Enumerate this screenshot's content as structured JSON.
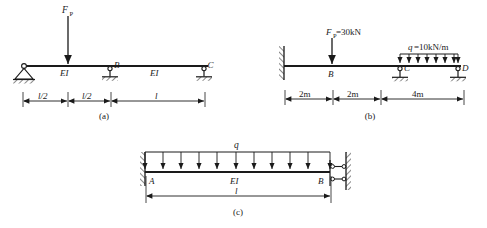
{
  "sheet": {
    "title": "Statically indeterminate beam examples",
    "background": "#ffffff",
    "ink": "#1a1a1a"
  },
  "figures": [
    {
      "id": "a",
      "caption": "(a)",
      "type": "continuous-beam",
      "supports": [
        {
          "at": "left",
          "kind": "pinned-hatched",
          "label": ""
        },
        {
          "at": "middle",
          "kind": "link-rod-hatched",
          "label": "B"
        },
        {
          "at": "right",
          "kind": "link-rod-hatched",
          "label": "C"
        }
      ],
      "loads": [
        {
          "kind": "point-load",
          "label": "F",
          "sub": "P",
          "value": "",
          "position": "l/2 from left"
        }
      ],
      "span_labels": [
        "EI",
        "EI"
      ],
      "dimensions": [
        {
          "text": "l/2"
        },
        {
          "text": "l/2"
        },
        {
          "text": "l"
        }
      ]
    },
    {
      "id": "b",
      "caption": "(b)",
      "type": "propped-beam",
      "supports": [
        {
          "at": "left",
          "kind": "fixed-wall",
          "label": ""
        },
        {
          "at": "C",
          "kind": "link-rod-hatched",
          "label": "C"
        },
        {
          "at": "D",
          "kind": "link-rod-hatched",
          "label": "D"
        }
      ],
      "loads": [
        {
          "kind": "point-load",
          "label": "F",
          "sub": "P",
          "value": "=30kN",
          "text": "F P =30kN"
        },
        {
          "kind": "distributed-load",
          "label": "q",
          "value": "=10kN/m",
          "text": "q=10kN/m"
        }
      ],
      "node_labels": [
        "B",
        "C",
        "D"
      ],
      "dimensions": [
        {
          "text": "2m"
        },
        {
          "text": "2m"
        },
        {
          "text": "4m"
        }
      ]
    },
    {
      "id": "c",
      "caption": "(c)",
      "type": "fixed-guided-beam",
      "supports": [
        {
          "at": "A",
          "kind": "fixed-wall",
          "label": "A"
        },
        {
          "at": "B",
          "kind": "double-link-guided",
          "label": "B"
        }
      ],
      "loads": [
        {
          "kind": "distributed-load",
          "label": "q",
          "value": "",
          "text": "q"
        }
      ],
      "span_labels": [
        "EI"
      ],
      "dimensions": [
        {
          "text": "l"
        }
      ]
    }
  ],
  "text": {
    "fp_main": "F",
    "fp_sub": "P",
    "fp_b_value": "=30kN",
    "q_b": "q",
    "q_b_value": "=10kN/m",
    "q_c": "q",
    "ei": "EI",
    "node_b_a": "B",
    "node_c_a": "C",
    "node_b_b": "B",
    "node_c_b": "C",
    "node_d_b": "D",
    "node_a_c": "A",
    "node_b_c": "B",
    "dim_a_1": "l/2",
    "dim_a_2": "l/2",
    "dim_a_3": "l",
    "dim_b_1": "2m",
    "dim_b_2": "2m",
    "dim_b_3": "4m",
    "dim_c_1": "l",
    "caption_a": "(a)",
    "caption_b": "(b)",
    "caption_c": "(c)"
  }
}
